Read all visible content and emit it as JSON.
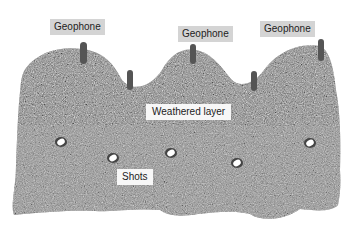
{
  "diagram": {
    "type": "seismic-refraction-cross-section",
    "colors": {
      "rock": "#8a8a8a",
      "rock_dark": "#5a5a5a",
      "rock_light": "#b5b5b5",
      "geophone": "#555555",
      "label_bg_grey": "#d4d4d4",
      "label_bg_white": "#f7f7f7",
      "shot": "#ffffff"
    },
    "labels": {
      "geophone_1": "Geophone",
      "geophone_2": "Geophone",
      "geophone_3": "Geophone",
      "weathered_layer": "Weathered layer",
      "shots": "Shots"
    },
    "geophones": [
      {
        "x": 83,
        "y": 42,
        "h": 22
      },
      {
        "x": 130,
        "y": 70,
        "h": 20
      },
      {
        "x": 193,
        "y": 44,
        "h": 20
      },
      {
        "x": 254,
        "y": 71,
        "h": 20
      },
      {
        "x": 321,
        "y": 39,
        "h": 22
      }
    ],
    "shots": [
      {
        "x": 61,
        "y": 142
      },
      {
        "x": 113,
        "y": 158
      },
      {
        "x": 171,
        "y": 153
      },
      {
        "x": 237,
        "y": 163
      },
      {
        "x": 310,
        "y": 143
      }
    ]
  }
}
